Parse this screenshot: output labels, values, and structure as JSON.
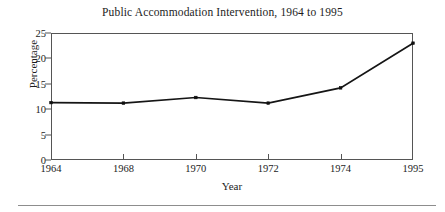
{
  "figure": {
    "name": "line-chart-figure",
    "background": "#ffffff",
    "axis_color": "#555555",
    "line_color": "#151515",
    "text_color": "#1c1c1c",
    "rule_color": "#8d8d8d"
  },
  "axis_labels": {
    "x": "Year",
    "y": "Percentage"
  },
  "chart_data": {
    "type": "line",
    "title": "Public Accommodation Intervention, 1964 to 1995",
    "xlabel": "Year",
    "ylabel": "Percentage",
    "categories": [
      "1964",
      "1968",
      "1970",
      "1972",
      "1974",
      "1995"
    ],
    "values": [
      11.3,
      11.2,
      12.3,
      11.2,
      14.2,
      23.0
    ],
    "ylim": [
      0,
      25
    ],
    "yticks": [
      0,
      5,
      10,
      15,
      20,
      25
    ],
    "ytick_labels": [
      "0",
      "5",
      "10",
      "15",
      "20",
      "25"
    ],
    "xtick_labels": [
      "1964",
      "1968",
      "1970",
      "1972",
      "1974",
      "1995"
    ],
    "grid": false,
    "legend": false,
    "marker": "square",
    "series": [
      {
        "name": "Percentage",
        "values": [
          11.3,
          11.2,
          12.3,
          11.2,
          14.2,
          23.0
        ]
      }
    ]
  }
}
